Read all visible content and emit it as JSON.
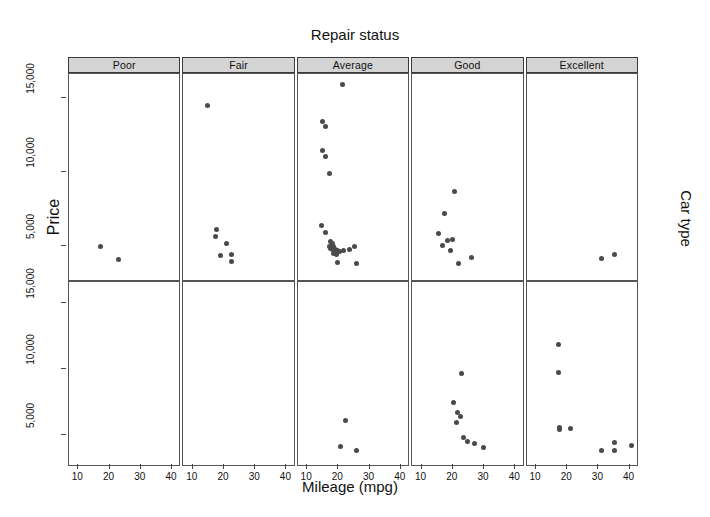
{
  "figure": {
    "top_title": "Repair status",
    "x_axis_label": "Mileage (mpg)",
    "y_axis_label": "Price",
    "right_label": "Car type"
  },
  "chart_data": {
    "type": "scatter",
    "title": "Repair status",
    "xlabel": "Mileage (mpg)",
    "ylabel": "Price",
    "right_label": "Car type",
    "grid": false,
    "legend": null,
    "xlim": [
      7,
      43
    ],
    "ylim": [
      2600,
      16600
    ],
    "xticks": [
      10,
      20,
      30,
      40
    ],
    "xticklabels": [
      "10",
      "20",
      "30",
      "40"
    ],
    "yticks": [
      5000,
      10000,
      15000
    ],
    "yticklabels": [
      "5,000",
      "10,000",
      "15,000"
    ],
    "columns": [
      "Poor",
      "Fair",
      "Average",
      "Good",
      "Excellent"
    ],
    "rows": [
      "Domestic",
      "Foreign"
    ],
    "marker_color": "#4a4a4a",
    "panels": [
      {
        "row": 0,
        "col": 0,
        "strip": "Poor",
        "points": [
          [
            17.0,
            5020
          ],
          [
            23.0,
            4120
          ]
        ]
      },
      {
        "row": 0,
        "col": 1,
        "strip": "Fair",
        "points": [
          [
            14.8,
            14450
          ],
          [
            17.5,
            6120
          ],
          [
            17.2,
            5680
          ],
          [
            20.8,
            5180
          ],
          [
            18.8,
            4400
          ],
          [
            22.5,
            4420
          ],
          [
            22.5,
            3960
          ]
        ]
      },
      {
        "row": 0,
        "col": 2,
        "strip": "Average",
        "points": [
          [
            21.2,
            15900
          ],
          [
            15.0,
            13400
          ],
          [
            16.0,
            13050
          ],
          [
            14.8,
            11450
          ],
          [
            16.0,
            11050
          ],
          [
            17.3,
            9920
          ],
          [
            14.5,
            6420
          ],
          [
            16.0,
            5920
          ],
          [
            17.6,
            5320
          ],
          [
            18.0,
            5180
          ],
          [
            17.9,
            5060
          ],
          [
            17.2,
            4980
          ],
          [
            18.4,
            4960
          ],
          [
            17.6,
            4880
          ],
          [
            18.1,
            4820
          ],
          [
            19.2,
            4780
          ],
          [
            19.8,
            4720
          ],
          [
            18.3,
            4520
          ],
          [
            19.3,
            4480
          ],
          [
            20.2,
            4620
          ],
          [
            21.6,
            4700
          ],
          [
            23.5,
            4820
          ],
          [
            25.3,
            5020
          ],
          [
            19.6,
            3900
          ],
          [
            25.9,
            3860
          ]
        ]
      },
      {
        "row": 0,
        "col": 3,
        "strip": "Good",
        "points": [
          [
            20.7,
            8700
          ],
          [
            17.2,
            7180
          ],
          [
            15.5,
            5880
          ],
          [
            18.2,
            5400
          ],
          [
            19.8,
            5460
          ],
          [
            16.8,
            5040
          ],
          [
            19.3,
            4720
          ],
          [
            21.7,
            3820
          ],
          [
            26.0,
            4220
          ]
        ]
      },
      {
        "row": 0,
        "col": 4,
        "strip": "Excellent",
        "points": [
          [
            31.0,
            4180
          ],
          [
            35.2,
            4420
          ]
        ]
      },
      {
        "row": 1,
        "col": 0,
        "strip": "Poor",
        "points": []
      },
      {
        "row": 1,
        "col": 1,
        "strip": "Fair",
        "points": []
      },
      {
        "row": 1,
        "col": 2,
        "strip": "Average",
        "points": [
          [
            22.2,
            6100
          ],
          [
            20.8,
            4180
          ],
          [
            25.8,
            3860
          ]
        ]
      },
      {
        "row": 1,
        "col": 3,
        "strip": "Good",
        "points": [
          [
            22.8,
            9650
          ],
          [
            20.3,
            7500
          ],
          [
            21.4,
            6700
          ],
          [
            22.6,
            6420
          ],
          [
            21.3,
            5960
          ],
          [
            23.4,
            4820
          ],
          [
            24.6,
            4560
          ],
          [
            27.0,
            4360
          ],
          [
            29.8,
            4060
          ]
        ]
      },
      {
        "row": 1,
        "col": 4,
        "strip": "Excellent",
        "points": [
          [
            17.2,
            11900
          ],
          [
            17.2,
            9720
          ],
          [
            17.4,
            5620
          ],
          [
            17.4,
            5420
          ],
          [
            21.0,
            5520
          ],
          [
            35.0,
            4440
          ],
          [
            31.0,
            3860
          ],
          [
            35.0,
            3880
          ],
          [
            40.6,
            4200
          ]
        ]
      }
    ]
  }
}
